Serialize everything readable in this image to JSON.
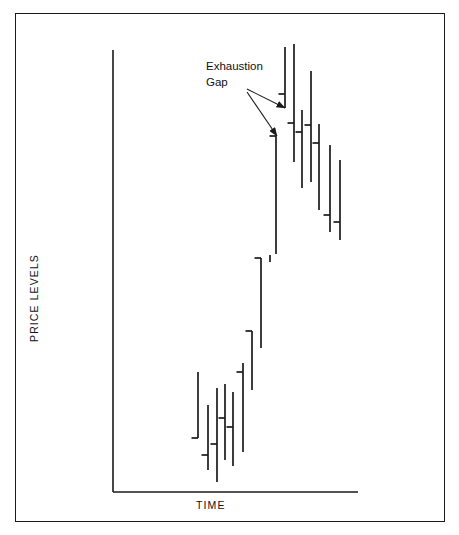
{
  "chart_data": {
    "type": "bar",
    "chart_style": "ohlc-hlc-price-bars",
    "title": "",
    "subtitle": "",
    "xlabel": "TIME",
    "ylabel": "PRICE LEVELS",
    "grid": false,
    "legend": null,
    "xlim": [
      0,
      100
    ],
    "ylim": [
      0,
      100
    ],
    "axis_ticks": {
      "x": [],
      "y": []
    },
    "annotations": [
      {
        "id": "exhaustion-gap",
        "text": "Exhaustion\nGap",
        "text_x": 206,
        "text_y": 59,
        "arrows": [
          {
            "from_x": 247,
            "from_y": 89,
            "to_x": 285,
            "to_y": 108
          },
          {
            "from_x": 247,
            "from_y": 92,
            "to_x": 277,
            "to_y": 136
          }
        ]
      }
    ],
    "series": [
      {
        "name": "Price bars",
        "description": "High-low price bars with closing tick marks, rising trend then gap up then decline",
        "bars": [
          {
            "i": 1,
            "x": 198,
            "high": 372,
            "low": 438,
            "tick_side": "left",
            "tick_y": 438
          },
          {
            "i": 2,
            "x": 208,
            "high": 405,
            "low": 470,
            "tick_side": "left",
            "tick_y": 455
          },
          {
            "i": 3,
            "x": 217,
            "high": 388,
            "low": 482,
            "tick_side": "left",
            "tick_y": 444
          },
          {
            "i": 4,
            "x": 225,
            "high": 384,
            "low": 460,
            "tick_side": "left",
            "tick_y": 418
          },
          {
            "i": 5,
            "x": 233,
            "high": 392,
            "low": 466,
            "tick_side": "left",
            "tick_y": 427
          },
          {
            "i": 6,
            "x": 243,
            "high": 363,
            "low": 452,
            "tick_side": "left",
            "tick_y": 372
          },
          {
            "i": 7,
            "x": 252,
            "high": 331,
            "low": 390,
            "tick_side": "left",
            "tick_y": 331
          },
          {
            "i": 8,
            "x": 261,
            "high": 258,
            "low": 348,
            "tick_side": "left",
            "tick_y": 258
          },
          {
            "i": 9,
            "x": 270,
            "high": 255,
            "low": 262,
            "tick_side": "none",
            "tick_y": 0
          },
          {
            "i": 10,
            "x": 276,
            "high": 136,
            "low": 254,
            "tick_side": "left",
            "tick_y": 136
          },
          {
            "i": 11,
            "x": 285,
            "high": 47,
            "low": 108,
            "tick_side": "left",
            "tick_y": 94
          },
          {
            "i": 12,
            "x": 294,
            "high": 44,
            "low": 162,
            "tick_side": "left",
            "tick_y": 123
          },
          {
            "i": 13,
            "x": 302,
            "high": 110,
            "low": 188,
            "tick_side": "left",
            "tick_y": 132
          },
          {
            "i": 14,
            "x": 311,
            "high": 71,
            "low": 182,
            "tick_side": "left",
            "tick_y": 125
          },
          {
            "i": 15,
            "x": 319,
            "high": 124,
            "low": 210,
            "tick_side": "left",
            "tick_y": 143
          },
          {
            "i": 16,
            "x": 330,
            "high": 145,
            "low": 232,
            "tick_side": "left",
            "tick_y": 215
          },
          {
            "i": 17,
            "x": 340,
            "high": 160,
            "low": 240,
            "tick_side": "left",
            "tick_y": 222
          }
        ]
      }
    ],
    "axes_geometry": {
      "y_axis_x": 113,
      "y_axis_top": 50,
      "y_axis_bottom": 492,
      "x_axis_y": 492,
      "x_axis_left": 113,
      "x_axis_right": 358
    },
    "colors": {
      "ink": "#1a1a1a",
      "background": "#ffffff",
      "frame": "#1a1a1a"
    }
  }
}
